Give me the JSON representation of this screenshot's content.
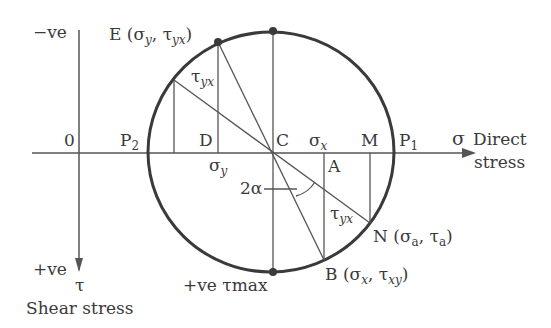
{
  "colors": {
    "ink": "#3a3a3a",
    "line": "#555555",
    "background": "#ffffff"
  },
  "axes": {
    "horizontal": {
      "symbol": "σ",
      "label_line1": "Direct",
      "label_line2": "stress"
    },
    "vertical": {
      "top_label": "−ve",
      "bottom_label": "+ve",
      "symbol": "τ",
      "caption": "Shear stress"
    },
    "origin": "0"
  },
  "points": {
    "E": {
      "name": "E",
      "coord_open": " (σ",
      "sub1": "y",
      "mid": ", τ",
      "sub2": "yx",
      "close": ")"
    },
    "B": {
      "name": "B",
      "coord_open": " (σ",
      "sub1": "x",
      "mid": ", τ",
      "sub2": "xy",
      "close": ")"
    },
    "N": {
      "name": "N",
      "coord_open": " (σ",
      "sub1": "a",
      "mid": ", τ",
      "sub2": "a",
      "close": ")"
    },
    "C": "C",
    "D": "D",
    "A": "A",
    "M": "M",
    "P1": {
      "name": "P",
      "sub": "1"
    },
    "P2": {
      "name": "P",
      "sub": "2"
    }
  },
  "annotations": {
    "sigma_x": {
      "sym": "σ",
      "sub": "x"
    },
    "sigma_y": {
      "sym": "σ",
      "sub": "y"
    },
    "tau_yx_upper": {
      "sym": "τ",
      "sub": "yx"
    },
    "tau_yx_lower": {
      "sym": "τ",
      "sub": "yx"
    },
    "angle": "2α",
    "tau_max": "+ve τmax"
  }
}
